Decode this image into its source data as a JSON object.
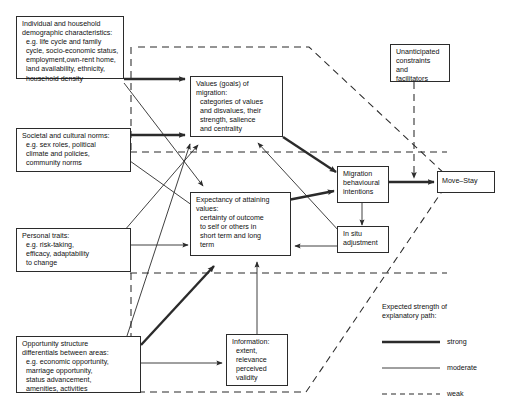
{
  "figure": {
    "type": "flow-diagram",
    "background": "#ffffff",
    "line_color": "#2b2b2b"
  },
  "nodes": [
    {
      "id": "individual-household",
      "label": "Individual and household\ndemographic characteristics:\n  e.g. life cycle and family\n  cycle, socio-economic status,\n  employment,own-rent home,\n  land availability, ethnicity,\n  household density"
    },
    {
      "id": "societal-cultural-norms",
      "label": "Societal and cultural norms:\n  e.g. sex roles, political\n  climate and policies,\n  community norms"
    },
    {
      "id": "personal-traits",
      "label": "Personal traits:\n  e.g. risk-taking,\n  efficacy, adaptability\n  to change"
    },
    {
      "id": "opportunity-structure",
      "label": "Opportunity structure\ndifferentials between areas:\n  e.g. economic opportunity,\n  marriage opportunity,\n  status advancement,\n  amenities, activities"
    },
    {
      "id": "values-goals",
      "label": "Values (goals) of\nmigration:\n  categories of values\n  and disvalues, their\n  strength, salience\n  and centrality"
    },
    {
      "id": "expectancy",
      "label": "Expectancy of attaining\nvalues:\n  certainty of outcome\n  to self or others in\n  short term and long\n  term"
    },
    {
      "id": "information",
      "label": "Information:\n  extent,\n  relevance\n  perceived\n  validity"
    },
    {
      "id": "unanticipated",
      "label": "Unanticipated\nconstraints\nand\nfacilitators"
    },
    {
      "id": "migration-intentions",
      "label": "Migration\nbehavioural\nintentions"
    },
    {
      "id": "in-situ-adjustment",
      "label": "In situ\nadjustment"
    },
    {
      "id": "move-stay",
      "label": "Move–Stay"
    }
  ],
  "legend": {
    "title": "Expected strength of\nexplanatory path:",
    "entries": [
      {
        "id": "strong",
        "label": "strong",
        "style": "thick-solid",
        "width_px": 2.6
      },
      {
        "id": "moderate",
        "label": "moderate",
        "style": "thin-solid",
        "width_px": 0.9
      },
      {
        "id": "weak",
        "label": "weak",
        "style": "dashed",
        "width_px": 1.1
      }
    ]
  }
}
